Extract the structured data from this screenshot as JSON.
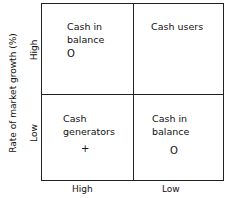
{
  "diagram": {
    "y_axis_title": "Rate of market growth (%)",
    "y_ticks": [
      "High",
      "Low"
    ],
    "x_ticks": [
      "High",
      "Low"
    ],
    "quadrants": [
      {
        "position": "top-left",
        "label_line1": "Cash in",
        "label_line2": "balance",
        "marker": "O"
      },
      {
        "position": "top-right",
        "label_line1": "Cash users",
        "label_line2": "",
        "marker": ""
      },
      {
        "position": "bottom-left",
        "label_line1": "Cash",
        "label_line2": "generators",
        "marker": "+"
      },
      {
        "position": "bottom-right",
        "label_line1": "Cash in",
        "label_line2": "balance",
        "marker": "O"
      }
    ]
  }
}
